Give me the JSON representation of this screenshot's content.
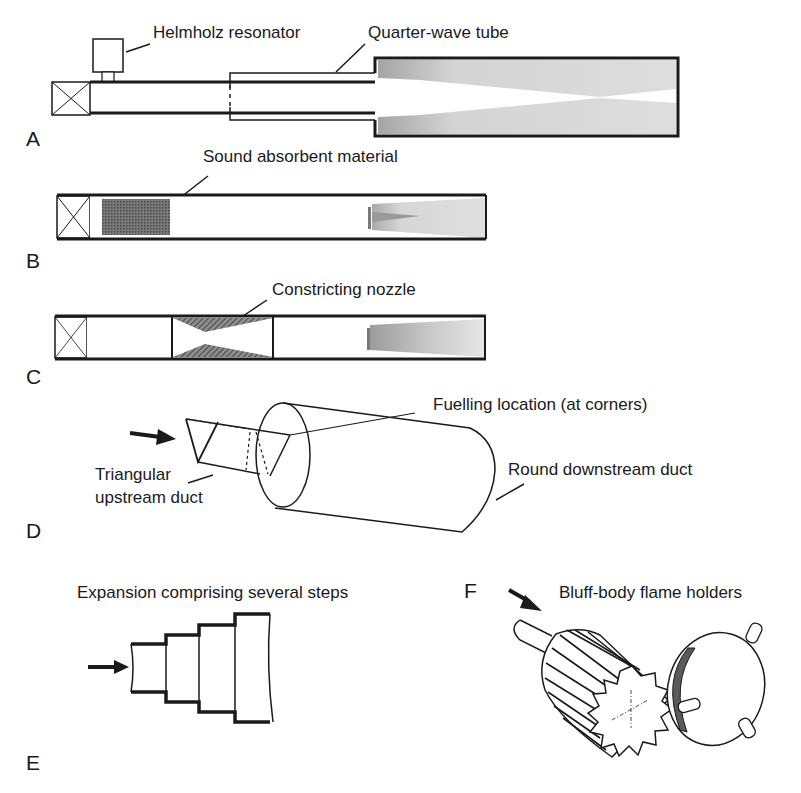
{
  "figure": {
    "panels": [
      {
        "id": "A",
        "letter": "A",
        "labels": [
          "Helmholz resonator",
          "Quarter-wave tube"
        ]
      },
      {
        "id": "B",
        "letter": "B",
        "labels": [
          "Sound absorbent material"
        ]
      },
      {
        "id": "C",
        "letter": "C",
        "labels": [
          "Constricting nozzle"
        ]
      },
      {
        "id": "D",
        "letter": "D",
        "labels": [
          "Fuelling location (at corners)",
          "Triangular",
          "upstream duct",
          "Round downstream duct"
        ]
      },
      {
        "id": "E",
        "letter": "E",
        "labels": [
          "Expansion comprising several steps"
        ]
      },
      {
        "id": "F",
        "letter": "F",
        "labels": [
          "Bluff-body flame holders"
        ]
      }
    ],
    "colors": {
      "line": "#1a1a1a",
      "flame_fill": "#d8d8d8",
      "absorbent_fill": "#6a6a6a",
      "nozzle_fill": "#5a5a5a"
    }
  }
}
